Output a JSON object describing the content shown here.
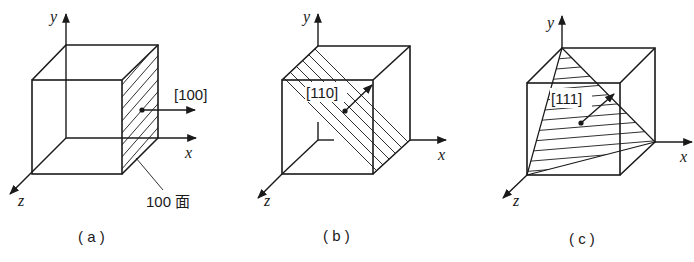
{
  "figure": {
    "panels": [
      {
        "id": "a",
        "caption": "( a )",
        "plane_label": "100 面",
        "direction_label": "[100]",
        "axes": {
          "x": "x",
          "y": "y",
          "z": "z"
        },
        "description": "Cube with hatched right face (100 plane) and normal arrow [100] pointing along +x"
      },
      {
        "id": "b",
        "caption": "( b )",
        "direction_label": "[110]",
        "axes": {
          "x": "x",
          "y": "y",
          "z": "z"
        },
        "description": "Cube with hatched diagonal plane (110) and normal arrow [110]"
      },
      {
        "id": "c",
        "caption": "( c )",
        "direction_label": "[111]",
        "axes": {
          "x": "x",
          "y": "y",
          "z": "z"
        },
        "description": "Cube with hatched triangular plane (111) and normal arrow [111]"
      }
    ],
    "colors": {
      "ink": "#1a1a1a",
      "background": "#ffffff"
    }
  }
}
